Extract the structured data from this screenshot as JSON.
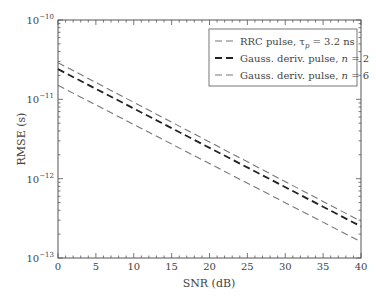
{
  "chart_data": {
    "type": "line",
    "title": "",
    "xlabel": "SNR (dB)",
    "ylabel": "RMSE (s)",
    "xlim": [
      0,
      40
    ],
    "ylim": [
      1e-13,
      1e-10
    ],
    "yscale": "log",
    "x_ticks": [
      "0",
      "5",
      "10",
      "15",
      "20",
      "25",
      "30",
      "35",
      "40"
    ],
    "y_ticks": [
      {
        "base": "10",
        "exp": "−10",
        "value": 1e-10
      },
      {
        "base": "10",
        "exp": "−11",
        "value": 1e-11
      },
      {
        "base": "10",
        "exp": "−12",
        "value": 1e-12
      },
      {
        "base": "10",
        "exp": "−13",
        "value": 1e-13
      }
    ],
    "grid": false,
    "legend_position": "upper right",
    "x": [
      0,
      40
    ],
    "series": [
      {
        "name": "RRC pulse, τp = 3.2 ns",
        "legend_main": "RRC pulse, τ",
        "legend_sub": "p",
        "legend_tail": " = 3.2 ns",
        "values": [
          2.9e-11,
          2.9e-13
        ],
        "color": "#777777",
        "width": 1.1
      },
      {
        "name": "Gauss. deriv. pulse, n = 2",
        "legend_main": "Gauss. deriv. pulse, ",
        "legend_ital": "n",
        "legend_tail": " = 2",
        "values": [
          2.4e-11,
          2.5e-13
        ],
        "color": "#222222",
        "width": 1.8
      },
      {
        "name": "Gauss. deriv. pulse, n = 6",
        "legend_main": "Gauss. deriv. pulse, ",
        "legend_ital": "n",
        "legend_tail": " = 6",
        "values": [
          1.5e-11,
          1.6e-13
        ],
        "color": "#777777",
        "width": 1.1
      }
    ]
  }
}
